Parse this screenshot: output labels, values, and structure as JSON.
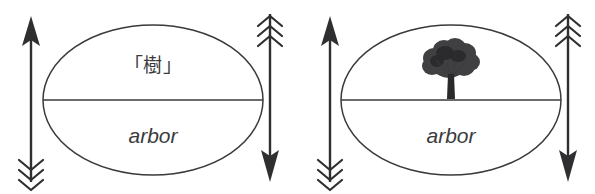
{
  "figure": {
    "background_color": "#ffffff",
    "ink_color": "#3a3a3c",
    "panel_count": 2
  },
  "panels": [
    {
      "id": "panel-left",
      "name": "sign-diagram-word",
      "signified": {
        "type": "text",
        "label": "「樹」",
        "position": "upper-half"
      },
      "signifier": {
        "type": "text",
        "label": "arbor",
        "style": "italic",
        "position": "lower-half"
      },
      "arrows": {
        "left": {
          "name": "up-arrow",
          "direction": "up",
          "head": "solid-triangle",
          "tail": "fletching"
        },
        "right": {
          "name": "down-arrow",
          "direction": "down",
          "head": "solid-triangle",
          "tail": "fletching"
        }
      }
    },
    {
      "id": "panel-right",
      "name": "sign-diagram-image",
      "signified": {
        "type": "illustration",
        "label": "tree-illustration",
        "position": "upper-half"
      },
      "signifier": {
        "type": "text",
        "label": "arbor",
        "style": "italic",
        "position": "lower-half"
      },
      "arrows": {
        "left": {
          "name": "up-arrow",
          "direction": "up",
          "head": "solid-triangle",
          "tail": "fletching"
        },
        "right": {
          "name": "down-arrow",
          "direction": "down",
          "head": "solid-triangle",
          "tail": "fletching"
        }
      }
    }
  ],
  "colors": {
    "stroke": "#3a3a3c",
    "arrow": "#2f2f31",
    "text": "#3b3b3d",
    "foliage": "#404043",
    "foliage_shade": "#2b2b2e",
    "trunk": "#2a2a2d",
    "background": "#ffffff"
  }
}
